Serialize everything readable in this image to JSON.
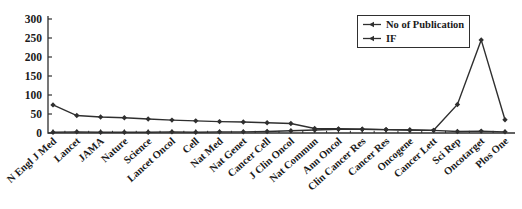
{
  "figure": {
    "background": "#ffffff",
    "axis_color": "#2f2f2f",
    "text_color": "#1a1a1a"
  },
  "legend": {
    "position": "top-right",
    "items": [
      {
        "label": "No of Publication"
      },
      {
        "label": "IF"
      }
    ]
  },
  "chart_data": {
    "type": "line",
    "title": "",
    "xlabel": "",
    "ylabel": "",
    "ylim": [
      0,
      300
    ],
    "yticks": [
      0,
      50,
      100,
      150,
      200,
      250,
      300
    ],
    "grid": false,
    "legend_position": "top-right",
    "categories": [
      "N Engl J Med",
      "Lancet",
      "JAMA",
      "Nature",
      "Science",
      "Lancet Oncol",
      "Cell",
      "Nat Med",
      "Nat Genet",
      "Cancer Cell",
      "J Clin Oncol",
      "Nat Commun",
      "Ann Oncol",
      "Clin Cancer Res",
      "Cancer Res",
      "Oncogene",
      "Cancer Lett",
      "Sci Rep",
      "Oncotarget",
      "Plos One"
    ],
    "series": [
      {
        "name": "No of Publication",
        "color": "#2f2f2f",
        "values": [
          2,
          3,
          2,
          2,
          2,
          3,
          2,
          3,
          3,
          4,
          6,
          8,
          10,
          10,
          9,
          8,
          7,
          75,
          245,
          35
        ]
      },
      {
        "name": "IF",
        "color": "#2f2f2f",
        "values": [
          74,
          46,
          42,
          40,
          37,
          34,
          32,
          30,
          29,
          27,
          25,
          12,
          11,
          10,
          9,
          8,
          7,
          4,
          5,
          3
        ]
      }
    ]
  }
}
